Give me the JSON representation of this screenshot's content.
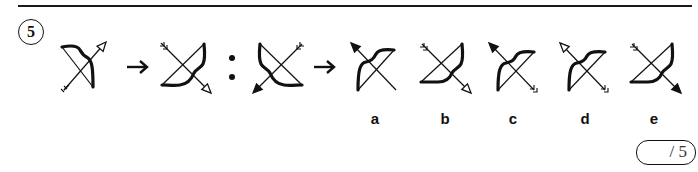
{
  "question": {
    "number": "5",
    "type": "visual-analogy",
    "pattern": [
      "figure-1",
      "arrow",
      "figure-2",
      "colon",
      "figure-3",
      "arrow"
    ],
    "figures": [
      {
        "id": "figure-1",
        "bow": "upper-right",
        "arrow_direction": "up-right",
        "arrow_head": "hollow"
      },
      {
        "id": "figure-2",
        "bow": "lower-right",
        "arrow_direction": "down-right",
        "arrow_head": "hollow"
      },
      {
        "id": "figure-3",
        "bow": "lower-left",
        "arrow_direction": "down-left",
        "arrow_head": "filled"
      }
    ]
  },
  "options": [
    {
      "label": "a",
      "bow": "upper-left",
      "arrow_direction": "up-left",
      "arrow_head": "filled"
    },
    {
      "label": "b",
      "bow": "lower-right",
      "arrow_direction": "down-right",
      "arrow_head": "hollow"
    },
    {
      "label": "c",
      "bow": "upper-left",
      "arrow_direction": "up-left",
      "arrow_head": "filled"
    },
    {
      "label": "d",
      "bow": "upper-left",
      "arrow_direction": "up-left",
      "arrow_head": "hollow"
    },
    {
      "label": "e",
      "bow": "lower-right",
      "arrow_direction": "down-right",
      "arrow_head": "filled"
    }
  ],
  "score": {
    "text": "/ 5"
  },
  "colors": {
    "ink": "#111111",
    "background": "#ffffff"
  }
}
